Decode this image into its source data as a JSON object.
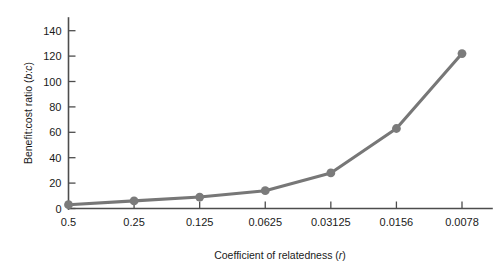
{
  "chart_data": {
    "type": "line",
    "title": "",
    "xlabel": "Coefficient of relatedness (r)",
    "ylabel": "Benefit:cost ratio (b:c)",
    "xlabel_plain": "Coefficient of relatedness",
    "xlabel_italic": "r",
    "ylabel_plain": "Benefit:cost ratio",
    "ylabel_italic": "b:c",
    "categories": [
      "0.5",
      "0.25",
      "0.125",
      "0.0625",
      "0.03125",
      "0.0156",
      "0.0078"
    ],
    "x": [
      0.5,
      0.25,
      0.125,
      0.0625,
      0.03125,
      0.0156,
      0.0078
    ],
    "values": [
      3,
      6,
      9,
      14,
      28,
      63,
      122
    ],
    "series": [
      {
        "name": "benefit-cost-ratio",
        "values": [
          3,
          6,
          9,
          14,
          28,
          63,
          122
        ],
        "color": "#777777",
        "marker": "circle"
      }
    ],
    "ylim": [
      0,
      150
    ],
    "yticks": [
      0,
      20,
      40,
      60,
      80,
      100,
      120,
      140
    ],
    "ytick_labels": [
      "0",
      "20",
      "40",
      "60",
      "80",
      "100",
      "120",
      "140"
    ],
    "grid": false,
    "legend": false,
    "legend_position": "none",
    "line_color": "#777777",
    "marker_color": "#7b7b7b",
    "axis_color": "#4d4d4d",
    "background": "#ffffff"
  }
}
